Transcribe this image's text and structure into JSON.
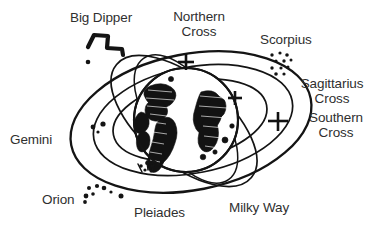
{
  "diagram": {
    "ink_color": "#1a1a1a",
    "text_color": "#2f2f2f",
    "background": "#ffffff",
    "labels": {
      "big_dipper": "Big Dipper",
      "northern_cross_line1": "Northern",
      "northern_cross_line2": "Cross",
      "scorpius": "Scorpius",
      "sagittarius_cross_line1": "Sagittarius",
      "sagittarius_cross_line2": "Cross",
      "southern_cross_line1": "Southern",
      "southern_cross_line2": "Cross",
      "gemini": "Gemini",
      "orion": "Orion",
      "pleiades": "Pleiades",
      "milky_way": "Milky Way"
    },
    "markers": {
      "northern_cross_symbol": "plus-cross",
      "sagittarius_cross_symbol": "plus-cross",
      "southern_cross_symbol": "plus-cross",
      "big_dipper_symbol": "zigzag-dipper",
      "scorpius_symbol": "star-scatter",
      "orion_symbol": "star-scatter",
      "gemini_symbol": "star-pair",
      "pleiades_symbol": "star-cluster",
      "earth_symbol": "earth-globe"
    },
    "orbits": [
      "outer-ellipse",
      "middle-ellipse",
      "inner-ellipse",
      "tilted-ellipse-a",
      "tilted-ellipse-b"
    ]
  }
}
